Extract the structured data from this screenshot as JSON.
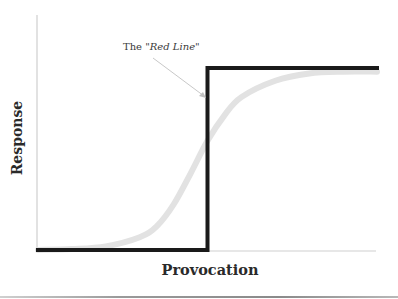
{
  "chart_data": {
    "type": "line",
    "title": "",
    "xlabel": "Provocation",
    "ylabel": "Response",
    "xlim": [
      0,
      1
    ],
    "ylim": [
      0,
      1
    ],
    "grid": false,
    "legend": null,
    "series": [
      {
        "name": "Gradual response (sigmoid)",
        "style": "thick light gray curve",
        "color": "#e2e2e2",
        "x": [
          0.0,
          0.1,
          0.2,
          0.3,
          0.35,
          0.4,
          0.45,
          0.5,
          0.55,
          0.6,
          0.7,
          0.8,
          0.9,
          1.0
        ],
        "y": [
          0.0,
          0.005,
          0.02,
          0.07,
          0.13,
          0.25,
          0.42,
          0.6,
          0.74,
          0.84,
          0.93,
          0.97,
          0.98,
          0.98
        ]
      },
      {
        "name": "Step response",
        "style": "thick black step line",
        "color": "#1a1a1a",
        "x": [
          0.0,
          0.5,
          0.5,
          1.0
        ],
        "y": [
          0.0,
          0.0,
          1.0,
          1.0
        ]
      }
    ],
    "annotations": [
      {
        "text_prefix": "The ",
        "text_emphasis": "\"Red Line\"",
        "points_to": {
          "x": 0.5,
          "y": 0.83
        },
        "arrow_color": "#c8c8c8"
      }
    ]
  },
  "labels": {
    "x_axis": "Provocation",
    "y_axis": "Response",
    "annotation_prefix": "The ",
    "annotation_emphasis": "\"Red Line\""
  },
  "colors": {
    "step_line": "#1a1a1a",
    "sigmoid": "#e2e2e2",
    "axis": "#cfcfcf",
    "arrow": "#c8c8c8",
    "text": "#2a2a2a"
  }
}
